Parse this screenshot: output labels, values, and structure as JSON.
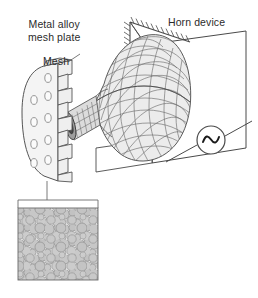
{
  "figure": {
    "width": 258,
    "height": 298,
    "background": "#ffffff",
    "type": "technical-schematic-diagram"
  },
  "labels": {
    "metal_alloy_line1": "Metal alloy",
    "metal_alloy_line2": "mesh plate",
    "mesh": "Mesh",
    "horn_device": "Horn device"
  },
  "components": {
    "mesh_plate": {
      "name": "Metal alloy mesh plate",
      "hole_count": 9,
      "hole_columns": 3,
      "hole_rows": 3,
      "fill": "#f2f2f2",
      "stroke": "#555555"
    },
    "horn": {
      "name": "Horn device",
      "mesh_type": "finite-element quad mesh",
      "fill": "#ececec",
      "stroke": "#5a5a5a",
      "shape": "bell / conical horn with narrow neck"
    },
    "support_hatching": {
      "name": "fixed support hatching",
      "stroke": "#4a4a4a"
    },
    "ac_source": {
      "name": "AC signal generator",
      "symbol": "sine-wave",
      "stroke": "#4a4a4a",
      "fill": "#ffffff",
      "cx": 211,
      "cy": 140,
      "r": 14
    },
    "plane": {
      "name": "mounting plane",
      "stroke": "#4a4a4a",
      "fill": "#ffffff"
    },
    "inset": {
      "name": "mesh micrograph inset",
      "background": "#dcdcdc",
      "circle_fill": "#c9c9c9",
      "circle_stroke": "#a3a3a3",
      "border": "#6b6b6b",
      "x": 18,
      "y": 200,
      "width": 80,
      "height": 80
    },
    "leader_line": {
      "name": "leader line from plate to inset",
      "stroke": "#6b6b6b"
    }
  },
  "colors": {
    "text": "#2b2b2b",
    "line_dark": "#4a4a4a",
    "line_mid": "#6b6b6b",
    "line_light": "#9a9a9a",
    "fill_light": "#f2f2f2",
    "fill_mid": "#e2e2e2",
    "fill_gray": "#cfcfcf"
  }
}
